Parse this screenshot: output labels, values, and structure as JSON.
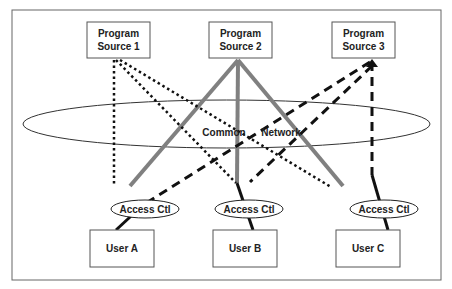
{
  "diagram": {
    "title": "",
    "sources": [
      {
        "line1": "Program",
        "line2": "Source 1"
      },
      {
        "line1": "Program",
        "line2": "Source 2"
      },
      {
        "line1": "Program",
        "line2": "Source 3"
      }
    ],
    "network": {
      "left_label": "Common",
      "right_label": "Network"
    },
    "access_controls": [
      {
        "label": "Access Ctl"
      },
      {
        "label": "Access Ctl"
      },
      {
        "label": "Access Ctl"
      }
    ],
    "users": [
      {
        "label": "User A"
      },
      {
        "label": "User B"
      },
      {
        "label": "User C"
      }
    ],
    "line_styles": {
      "source1": "dotted",
      "source2": "solid-gray",
      "source3": "dashed"
    },
    "colors": {
      "border": "#666666",
      "box_stroke": "#555555",
      "source2_line": "#808080",
      "dark_line": "#111111",
      "text": "#222222"
    }
  }
}
